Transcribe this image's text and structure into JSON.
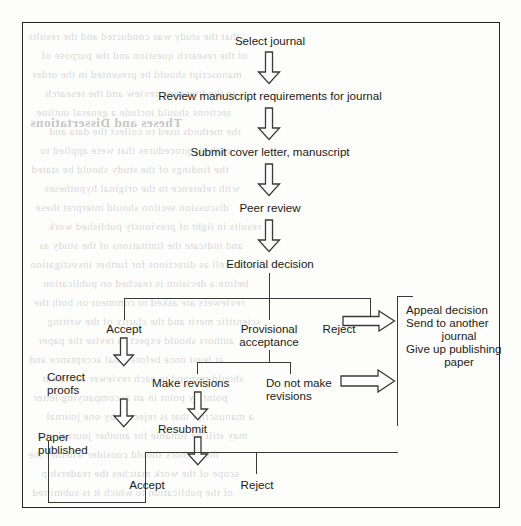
{
  "figure": {
    "type": "flowchart",
    "orientation": "top-to-bottom with lateral branches",
    "border_color": "#23231f",
    "text_color": "#1b1b18",
    "line_color": "#3a3a35"
  },
  "nodes": {
    "select_journal": "Select journal",
    "review_requirements": "Review manuscript requirements for journal",
    "submit": "Submit cover letter, manuscript",
    "peer_review": "Peer review",
    "editorial_decision": "Editorial decision",
    "accept": "Accept",
    "provisional_acceptance_line1": "Provisional",
    "provisional_acceptance_line2": "acceptance",
    "reject": "Reject",
    "outcomes_line1": "Appeal decision",
    "outcomes_line2": "Send to another",
    "outcomes_line3": "journal",
    "outcomes_line4": "Give up publishing",
    "outcomes_line5": "paper",
    "correct_proofs_line1": "Correct",
    "correct_proofs_line2": "proofs",
    "make_revisions": "Make revisions",
    "do_not_make_revisions_line1": "Do not make",
    "do_not_make_revisions_line2": "revisions",
    "paper_published_line1": "Paper",
    "paper_published_line2": "published",
    "resubmit": "Resubmit",
    "accept_2": "Accept",
    "reject_2": "Reject"
  },
  "icons": {
    "arrow_down": "arrow-down-icon",
    "arrow_right": "arrow-right-icon"
  },
  "bleed_through_text": {
    "heading": "Theses and Dissertations",
    "lines": [
      "that the study was conducted and the results",
      "of the research question and the purpose of",
      "manuscript should be presented in the order",
      "to the literature review and the research",
      "sections should include a general outline",
      "the methods used to collect the data and",
      "analysis procedures that were applied to",
      "the findings of the study should be stated",
      "with reference to the original hypotheses",
      "discussion section should interpret these",
      "results in light of previously published work",
      "and indicate the limitations of the study as",
      "well as directions for further investigation",
      "before a decision is reached on publication",
      "reviewers are asked to comment on both the",
      "scientific merit and the clarity of the writing",
      "authors should expect to revise the paper",
      "at least once before final acceptance and",
      "should respond to each reviewer comment",
      "point by point in an accompanying letter",
      "a manuscript that is rejected by one journal",
      "may still be suitable for another journal and",
      "the authors should consider whether the",
      "scope of the work matches the readership",
      "of the publication to which it is submitted"
    ]
  }
}
